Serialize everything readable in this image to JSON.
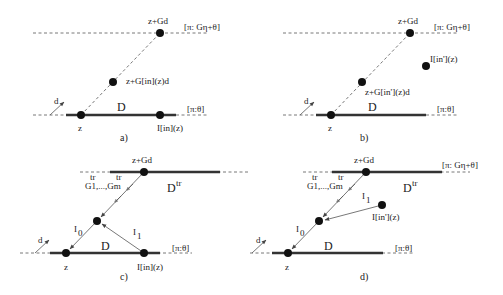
{
  "diagram": {
    "panels": [
      {
        "id": "a",
        "caption": "a)",
        "top_point_label": "z+Gd",
        "top_line_label": "[π: Gη+θ]",
        "mid_point_label": "z+G[in](z)d",
        "domain_label": "D",
        "bottom_line_label": "[π:θ]",
        "z_label": "z",
        "image_label": "I[in](z)",
        "direction_label": "d"
      },
      {
        "id": "b",
        "caption": "b)",
        "top_point_label": "z+Gd",
        "top_line_label": "[π: Gη+θ]",
        "mid_point_label": "z+G[in'](z)d",
        "image_label": "I[in'](z)",
        "domain_label": "D",
        "bottom_line_label": "[π:θ]",
        "z_label": "z",
        "direction_label": "d"
      },
      {
        "id": "c",
        "caption": "c)",
        "top_point_label": "z+Gd",
        "top_line_label": "[π: Gη+θ]",
        "transpose_label": "G1,...,Gm",
        "tr_sup_1": "tr",
        "tr_sup_2": "tr",
        "top_domain_label": "D",
        "top_domain_sup": "tr",
        "I0_label": "I",
        "I0_sub": "0",
        "I1_label": "I",
        "I1_sub": "1",
        "domain_label": "D",
        "bottom_line_label": "[π:θ]",
        "z_label": "z",
        "image_label": "I[in](z)",
        "direction_label": "d"
      },
      {
        "id": "d",
        "caption": "d)",
        "top_point_label": "z+Gd",
        "top_line_label": "[π: Gη+θ]",
        "transpose_label": "G1,...,Gm",
        "tr_sup_1": "tr",
        "tr_sup_2": "tr",
        "top_domain_label": "D",
        "top_domain_sup": "tr",
        "I0_label": "I",
        "I0_sub": "0",
        "I1_label": "I",
        "I1_sub": "1",
        "image_label": "I[in'](z)",
        "domain_label": "D",
        "bottom_line_label": "[π:θ]",
        "z_label": "z",
        "direction_label": "d"
      }
    ]
  }
}
